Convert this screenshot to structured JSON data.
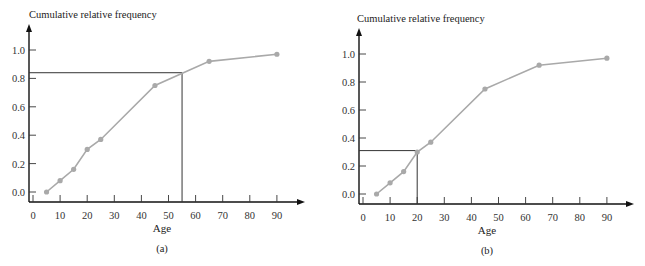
{
  "chart_data": [
    {
      "id": "a",
      "type": "line",
      "title": "",
      "ylabel": "Cumulative relative frequency",
      "xlabel": "Age",
      "caption": "(a)",
      "x_ticks": [
        0,
        10,
        20,
        30,
        40,
        50,
        60,
        70,
        80,
        90
      ],
      "y_ticks": [
        "0.0",
        "0.2",
        "0.4",
        "0.6",
        "0.8",
        "1.0"
      ],
      "xlim": [
        0,
        100
      ],
      "ylim": [
        0,
        1.1
      ],
      "grid": false,
      "series": [
        {
          "name": "Cumulative relative frequency",
          "x": [
            5,
            10,
            15,
            20,
            25,
            45,
            65,
            90
          ],
          "y": [
            0.0,
            0.08,
            0.16,
            0.3,
            0.37,
            0.75,
            0.92,
            0.97
          ],
          "color": "#a9a9a9"
        }
      ],
      "reference_lines": {
        "x": 55,
        "y": 0.84,
        "color": "#333333"
      }
    },
    {
      "id": "b",
      "type": "line",
      "title": "",
      "ylabel": "Cumulative relative frequency",
      "xlabel": "Age",
      "caption": "(b)",
      "x_ticks": [
        0,
        10,
        20,
        30,
        40,
        50,
        60,
        70,
        80,
        90
      ],
      "y_ticks": [
        "0.0",
        "0.2",
        "0.4",
        "0.6",
        "0.8",
        "1.0"
      ],
      "xlim": [
        0,
        100
      ],
      "ylim": [
        0,
        1.1
      ],
      "grid": false,
      "series": [
        {
          "name": "Cumulative relative frequency",
          "x": [
            5,
            10,
            15,
            20,
            25,
            45,
            65,
            90
          ],
          "y": [
            0.0,
            0.08,
            0.16,
            0.3,
            0.37,
            0.75,
            0.92,
            0.97
          ],
          "color": "#a9a9a9"
        }
      ],
      "reference_lines": {
        "x": 20,
        "y": 0.31,
        "color": "#333333"
      }
    }
  ],
  "layout": {
    "panels": [
      {
        "left": 0,
        "x0": 33,
        "dx10": 27.1,
        "y0": 192,
        "y1": 50,
        "axis_x": 29,
        "axis_y": 202,
        "axis_top": 24,
        "axis_right": 305,
        "title_x": 29,
        "title_y": 18,
        "xlabel_x": 162,
        "xlabel_y": 232,
        "caption_x": 162,
        "caption_y": 252
      },
      {
        "left": 0,
        "x0": 363,
        "dx10": 27.1,
        "y0": 194,
        "y1": 54,
        "axis_x": 359,
        "axis_y": 204,
        "axis_top": 28,
        "axis_right": 634,
        "title_x": 357,
        "title_y": 22,
        "xlabel_x": 487,
        "xlabel_y": 234,
        "caption_x": 487,
        "caption_y": 254
      }
    ]
  }
}
